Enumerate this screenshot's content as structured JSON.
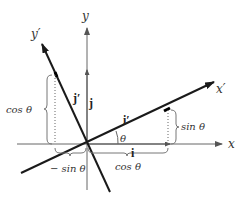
{
  "diagram": {
    "axes": {
      "x_label": "x",
      "y_label": "y",
      "x_prime_label": "x′",
      "y_prime_label": "y′"
    },
    "vectors": {
      "i_label": "i",
      "j_label": "j",
      "i_prime_label": "i′",
      "j_prime_label": "j′"
    },
    "angle_label": "θ",
    "components": {
      "i_prime_x": "cos θ",
      "i_prime_y": "sin θ",
      "j_prime_x": "− sin θ",
      "j_prime_y": "cos θ"
    },
    "rotation_angle_deg": 25,
    "colors": {
      "axis": "#555555",
      "rotated_axis": "#1a1a1a",
      "text": "#333333"
    }
  }
}
